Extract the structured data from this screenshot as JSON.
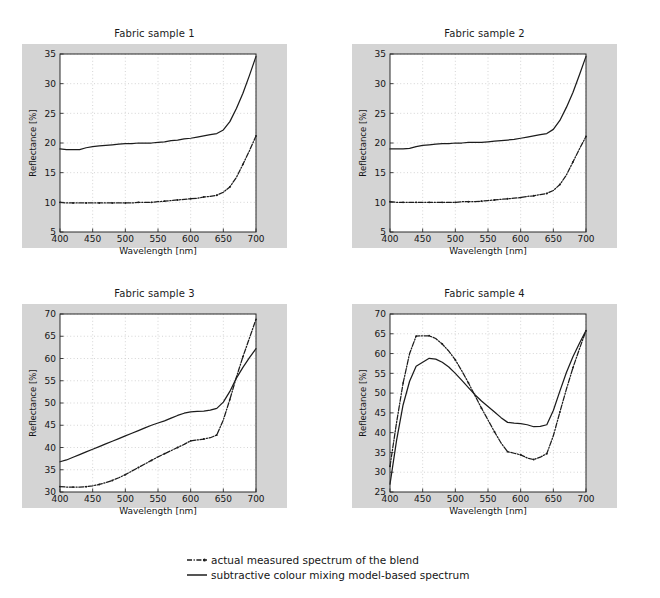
{
  "figure": {
    "background": "#ffffff",
    "panel_background": "#d4d4d4",
    "plot_background": "#ffffff",
    "axis_color": "#2b2b2b",
    "grid_color": "#b9b9b9",
    "series_colors": {
      "measured": "#1c1c1c",
      "model": "#1c1c1c"
    }
  },
  "legend": {
    "items": [
      {
        "key": "dashdot-line-key",
        "label": "actual measured spectrum of the blend"
      },
      {
        "key": "solid-line-key",
        "label": "subtractive colour mixing model-based spectrum"
      }
    ]
  },
  "chart_data": [
    {
      "type": "line",
      "title": "Fabric sample 1",
      "xlabel": "Wavelength [nm]",
      "ylabel": "Reflectance [%]",
      "xlim": [
        400,
        700
      ],
      "ylim": [
        5,
        35
      ],
      "xticks": [
        400,
        450,
        500,
        550,
        600,
        650,
        700
      ],
      "yticks": [
        5,
        10,
        15,
        20,
        25,
        30,
        35
      ],
      "grid": true,
      "legend_position": "below-figure",
      "x": [
        400,
        410,
        420,
        430,
        440,
        450,
        460,
        470,
        480,
        490,
        500,
        510,
        520,
        530,
        540,
        550,
        560,
        570,
        580,
        590,
        600,
        610,
        620,
        630,
        640,
        650,
        660,
        670,
        680,
        690,
        700
      ],
      "series": [
        {
          "name": "subtractive colour mixing model-based spectrum",
          "style": "solid",
          "values": [
            19.0,
            18.9,
            18.9,
            18.9,
            19.2,
            19.4,
            19.5,
            19.6,
            19.7,
            19.8,
            19.9,
            19.9,
            20.0,
            20.0,
            20.0,
            20.1,
            20.2,
            20.4,
            20.5,
            20.7,
            20.8,
            21.0,
            21.2,
            21.4,
            21.6,
            22.2,
            23.6,
            25.8,
            28.4,
            31.4,
            34.6
          ]
        },
        {
          "name": "actual measured spectrum of the blend",
          "style": "dashdot",
          "values": [
            10.0,
            9.9,
            9.9,
            9.9,
            9.9,
            9.9,
            9.9,
            9.9,
            9.9,
            9.9,
            9.9,
            9.9,
            10.0,
            10.0,
            10.0,
            10.1,
            10.2,
            10.3,
            10.4,
            10.5,
            10.6,
            10.7,
            10.9,
            11.0,
            11.2,
            11.7,
            12.6,
            14.2,
            16.4,
            18.7,
            21.2
          ]
        }
      ]
    },
    {
      "type": "line",
      "title": "Fabric sample 2",
      "xlabel": "Wavelength [nm]",
      "ylabel": "Reflectance [%]",
      "xlim": [
        400,
        700
      ],
      "ylim": [
        5,
        35
      ],
      "xticks": [
        400,
        450,
        500,
        550,
        600,
        650,
        700
      ],
      "yticks": [
        5,
        10,
        15,
        20,
        25,
        30,
        35
      ],
      "grid": true,
      "legend_position": "below-figure",
      "x": [
        400,
        410,
        420,
        430,
        440,
        450,
        460,
        470,
        480,
        490,
        500,
        510,
        520,
        530,
        540,
        550,
        560,
        570,
        580,
        590,
        600,
        610,
        620,
        630,
        640,
        650,
        660,
        670,
        680,
        690,
        700
      ],
      "series": [
        {
          "name": "subtractive colour mixing model-based spectrum",
          "style": "solid",
          "values": [
            19.0,
            19.0,
            19.0,
            19.1,
            19.4,
            19.6,
            19.7,
            19.8,
            19.9,
            19.9,
            20.0,
            20.0,
            20.1,
            20.1,
            20.1,
            20.2,
            20.3,
            20.4,
            20.5,
            20.6,
            20.8,
            21.0,
            21.2,
            21.4,
            21.6,
            22.3,
            23.8,
            26.0,
            28.5,
            31.5,
            34.6
          ]
        },
        {
          "name": "actual measured spectrum of the blend",
          "style": "dashdot",
          "values": [
            10.1,
            10.0,
            10.0,
            10.0,
            10.0,
            10.0,
            10.0,
            10.0,
            10.0,
            10.0,
            10.0,
            10.1,
            10.1,
            10.1,
            10.2,
            10.3,
            10.4,
            10.5,
            10.6,
            10.7,
            10.8,
            11.0,
            11.1,
            11.3,
            11.5,
            12.0,
            13.0,
            14.6,
            16.8,
            19.0,
            21.1
          ]
        }
      ]
    },
    {
      "type": "line",
      "title": "Fabric sample 3",
      "xlabel": "Wavelength [nm]",
      "ylabel": "Reflectance [%]",
      "xlim": [
        400,
        700
      ],
      "ylim": [
        30,
        70
      ],
      "xticks": [
        400,
        450,
        500,
        550,
        600,
        650,
        700
      ],
      "yticks": [
        30,
        35,
        40,
        45,
        50,
        55,
        60,
        65,
        70
      ],
      "grid": true,
      "legend_position": "below-figure",
      "x": [
        400,
        410,
        420,
        430,
        440,
        450,
        460,
        470,
        480,
        490,
        500,
        510,
        520,
        530,
        540,
        550,
        560,
        570,
        580,
        590,
        600,
        610,
        620,
        630,
        640,
        650,
        660,
        670,
        680,
        690,
        700
      ],
      "series": [
        {
          "name": "subtractive colour mixing model-based spectrum",
          "style": "solid",
          "values": [
            36.8,
            37.2,
            37.8,
            38.4,
            39.0,
            39.6,
            40.2,
            40.8,
            41.4,
            42.0,
            42.6,
            43.2,
            43.8,
            44.4,
            45.0,
            45.5,
            46.0,
            46.6,
            47.2,
            47.7,
            48.0,
            48.1,
            48.2,
            48.4,
            48.8,
            50.2,
            52.6,
            55.6,
            58.0,
            60.2,
            62.2
          ]
        },
        {
          "name": "actual measured spectrum of the blend",
          "style": "dashdot",
          "values": [
            31.2,
            31.1,
            31.1,
            31.1,
            31.2,
            31.4,
            31.7,
            32.1,
            32.6,
            33.2,
            33.9,
            34.7,
            35.5,
            36.3,
            37.1,
            37.9,
            38.6,
            39.3,
            40.0,
            40.7,
            41.5,
            41.7,
            41.9,
            42.2,
            42.8,
            46.2,
            50.8,
            55.8,
            60.4,
            64.6,
            68.8
          ]
        }
      ]
    },
    {
      "type": "line",
      "title": "Fabric sample 4",
      "xlabel": "Wavelength [nm]",
      "ylabel": "Reflectance [%]",
      "xlim": [
        400,
        700
      ],
      "ylim": [
        25,
        70
      ],
      "xticks": [
        400,
        450,
        500,
        550,
        600,
        650,
        700
      ],
      "yticks": [
        25,
        30,
        35,
        40,
        45,
        50,
        55,
        60,
        65,
        70
      ],
      "grid": true,
      "legend_position": "below-figure",
      "x": [
        400,
        410,
        420,
        430,
        440,
        450,
        460,
        470,
        480,
        490,
        500,
        510,
        520,
        530,
        540,
        550,
        560,
        570,
        580,
        590,
        600,
        610,
        620,
        630,
        640,
        650,
        660,
        670,
        680,
        690,
        700
      ],
      "series": [
        {
          "name": "subtractive colour mixing model-based spectrum",
          "style": "solid",
          "values": [
            27.0,
            38.0,
            47.0,
            53.0,
            56.8,
            57.8,
            58.8,
            58.6,
            57.8,
            56.6,
            55.0,
            53.2,
            51.4,
            49.6,
            48.0,
            46.6,
            45.2,
            43.8,
            42.6,
            42.4,
            42.3,
            42.0,
            41.5,
            41.6,
            42.0,
            45.6,
            50.5,
            55.2,
            59.2,
            62.6,
            65.8
          ]
        },
        {
          "name": "actual measured spectrum of the blend",
          "style": "dashdot",
          "values": [
            31.5,
            42.5,
            52.5,
            60.0,
            64.4,
            64.5,
            64.5,
            63.8,
            62.4,
            60.6,
            58.4,
            55.6,
            52.6,
            49.4,
            46.2,
            43.2,
            40.2,
            37.4,
            35.2,
            34.8,
            34.4,
            33.6,
            33.2,
            33.8,
            34.7,
            39.2,
            45.2,
            51.0,
            56.4,
            61.2,
            65.8
          ]
        }
      ]
    }
  ]
}
